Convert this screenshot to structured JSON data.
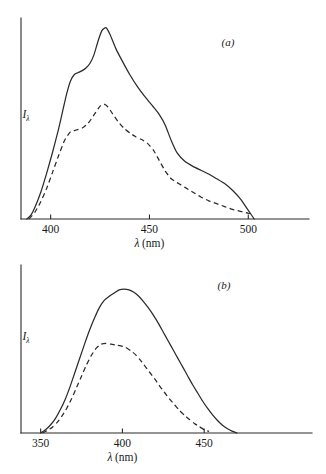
{
  "figure": {
    "background_color": "#ffffff",
    "ink_color": "#2b2b2b"
  },
  "chart_data": [
    {
      "type": "line",
      "panel_label": "(a)",
      "title": "",
      "xlabel": "λ (nm)",
      "ylabel": "Iλ",
      "ylabel_main": "I",
      "ylabel_sub": "λ",
      "xlim": [
        385,
        512
      ],
      "ylim": [
        0,
        1.05
      ],
      "xticks": [
        400,
        450,
        500
      ],
      "xtick_labels": [
        "400",
        "450",
        "500"
      ],
      "yticks": [],
      "ytick_labels": [],
      "grid": false,
      "legend_position": "none",
      "series": [
        {
          "name": "solid-curve",
          "style": "solid",
          "x": [
            388,
            390,
            392,
            395,
            398,
            401,
            404,
            406,
            408,
            410,
            412,
            414,
            416,
            418,
            420,
            422,
            424,
            426,
            428,
            430,
            433,
            436,
            440,
            444,
            448,
            452,
            455,
            458,
            461,
            464,
            468,
            472,
            476,
            480,
            484,
            488,
            492,
            496,
            500,
            503
          ],
          "y": [
            0.0,
            0.02,
            0.06,
            0.14,
            0.24,
            0.35,
            0.47,
            0.56,
            0.65,
            0.72,
            0.755,
            0.765,
            0.775,
            0.79,
            0.815,
            0.86,
            0.93,
            0.985,
            1.0,
            0.965,
            0.89,
            0.83,
            0.755,
            0.69,
            0.635,
            0.585,
            0.545,
            0.49,
            0.41,
            0.345,
            0.3,
            0.275,
            0.255,
            0.235,
            0.21,
            0.185,
            0.15,
            0.105,
            0.045,
            0.0
          ]
        },
        {
          "name": "dashed-curve",
          "style": "dashed",
          "x": [
            389,
            392,
            395,
            398,
            401,
            404,
            407,
            410,
            413,
            416,
            419,
            422,
            425,
            427,
            429,
            431,
            434,
            437,
            440,
            443,
            446,
            449,
            452,
            455,
            458,
            461,
            464,
            468,
            472,
            476,
            480,
            484,
            488,
            492,
            496,
            500,
            503
          ],
          "y": [
            0.0,
            0.035,
            0.09,
            0.16,
            0.245,
            0.33,
            0.41,
            0.455,
            0.465,
            0.475,
            0.5,
            0.545,
            0.59,
            0.6,
            0.585,
            0.555,
            0.51,
            0.475,
            0.45,
            0.43,
            0.415,
            0.395,
            0.36,
            0.305,
            0.25,
            0.21,
            0.19,
            0.165,
            0.14,
            0.115,
            0.095,
            0.08,
            0.065,
            0.05,
            0.04,
            0.03,
            0.025
          ]
        }
      ]
    },
    {
      "type": "line",
      "panel_label": "(b)",
      "title": "",
      "xlabel": "λ (nm)",
      "ylabel": "Iλ",
      "ylabel_main": "I",
      "ylabel_sub": "λ",
      "xlim": [
        338,
        478
      ],
      "ylim": [
        0,
        1.05
      ],
      "xticks": [
        350,
        400,
        450
      ],
      "xtick_labels": [
        "350",
        "400",
        "450"
      ],
      "yticks": [],
      "ytick_labels": [],
      "grid": false,
      "legend_position": "none",
      "series": [
        {
          "name": "solid-curve",
          "style": "solid",
          "x": [
            350,
            353,
            356,
            359,
            362,
            365,
            368,
            371,
            374,
            377,
            380,
            383,
            386,
            389,
            392,
            395,
            398,
            401,
            404,
            407,
            410,
            413,
            416,
            419,
            422,
            425,
            428,
            431,
            434,
            437,
            440,
            443,
            446,
            449,
            452,
            455,
            458,
            461,
            464,
            467,
            470
          ],
          "y": [
            0.0,
            0.02,
            0.05,
            0.09,
            0.145,
            0.21,
            0.29,
            0.38,
            0.47,
            0.56,
            0.645,
            0.72,
            0.785,
            0.83,
            0.855,
            0.875,
            0.895,
            0.9,
            0.895,
            0.88,
            0.855,
            0.82,
            0.78,
            0.735,
            0.685,
            0.63,
            0.575,
            0.52,
            0.465,
            0.41,
            0.355,
            0.3,
            0.25,
            0.2,
            0.155,
            0.115,
            0.08,
            0.05,
            0.028,
            0.012,
            0.0
          ]
        },
        {
          "name": "dashed-curve",
          "style": "dashed",
          "x": [
            351,
            354,
            357,
            360,
            363,
            366,
            369,
            372,
            375,
            378,
            381,
            384,
            387,
            390,
            393,
            396,
            399,
            402,
            405,
            408,
            411,
            414,
            417,
            420,
            423,
            426,
            429,
            432,
            435,
            438,
            441,
            444,
            447,
            450,
            453
          ],
          "y": [
            0.0,
            0.015,
            0.035,
            0.065,
            0.105,
            0.155,
            0.215,
            0.285,
            0.355,
            0.425,
            0.485,
            0.53,
            0.555,
            0.56,
            0.555,
            0.55,
            0.545,
            0.535,
            0.515,
            0.49,
            0.455,
            0.415,
            0.375,
            0.335,
            0.29,
            0.25,
            0.21,
            0.175,
            0.14,
            0.11,
            0.085,
            0.06,
            0.04,
            0.02,
            0.01
          ]
        }
      ]
    }
  ]
}
